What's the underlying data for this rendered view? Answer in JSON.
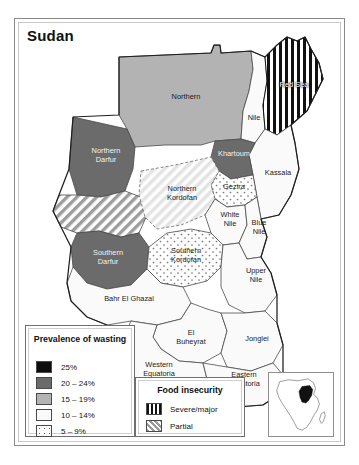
{
  "map": {
    "title": "Sudan",
    "regions": [
      {
        "name": "Northern",
        "label": "Northern",
        "wasting": "15 – 19%",
        "food_insecurity": "none"
      },
      {
        "name": "Nile",
        "label": "Nile",
        "wasting": "10 – 14%",
        "food_insecurity": "none"
      },
      {
        "name": "Red Sea",
        "label": "Red Sea",
        "wasting": "10 – 14%",
        "food_insecurity": "Severe/major"
      },
      {
        "name": "Kassala",
        "label": "Kassala",
        "wasting": "10 – 14%",
        "food_insecurity": "none"
      },
      {
        "name": "Khartoum",
        "label": "Khartoum",
        "wasting": "20 – 24%",
        "food_insecurity": "none"
      },
      {
        "name": "Gezira",
        "label": "Gezira",
        "wasting": "5 – 9%",
        "food_insecurity": "none"
      },
      {
        "name": "Northern Darfur",
        "label": "Northern\nDarfur",
        "wasting": "20 – 24%",
        "food_insecurity": "none"
      },
      {
        "name": "Western Darfur",
        "label": "",
        "wasting": "10 – 14%",
        "food_insecurity": "Partial"
      },
      {
        "name": "Southern Darfur",
        "label": "Southern\nDarfur",
        "wasting": "20 – 24%",
        "food_insecurity": "none"
      },
      {
        "name": "Northern Kordofan",
        "label": "Northern\nKordofan",
        "wasting": "10 – 14%",
        "food_insecurity": "Partial"
      },
      {
        "name": "Southern Kordofan",
        "label": "Southern\nKordofan",
        "wasting": "5 – 9%",
        "food_insecurity": "none"
      },
      {
        "name": "White Nile",
        "label": "White\nNile",
        "wasting": "10 – 14%",
        "food_insecurity": "none"
      },
      {
        "name": "Blue Nile",
        "label": "Blue\nNile",
        "wasting": "10 – 14%",
        "food_insecurity": "none"
      },
      {
        "name": "Upper Nile",
        "label": "Upper\nNile",
        "wasting": "10 – 14%",
        "food_insecurity": "none"
      },
      {
        "name": "Bahr El Ghazal",
        "label": "Bahr El Ghazal",
        "wasting": "10 – 14%",
        "food_insecurity": "none"
      },
      {
        "name": "El Buheyrat",
        "label": "El\nBuheyrat",
        "wasting": "10 – 14%",
        "food_insecurity": "none"
      },
      {
        "name": "Jonglei",
        "label": "Jonglei",
        "wasting": "10 – 14%",
        "food_insecurity": "none"
      },
      {
        "name": "Western Equatoria",
        "label": "Western\nEquatoria",
        "wasting": "10 – 14%",
        "food_insecurity": "none"
      },
      {
        "name": "Eastern Equatoria",
        "label": "Eastern\nEquatoria",
        "wasting": "10 – 14%",
        "food_insecurity": "none"
      }
    ]
  },
  "legend_wasting": {
    "title": "Prevalence of\nwasting",
    "items": [
      {
        "label": "25%",
        "swatch": "fill-25",
        "color": "#0d0d0d"
      },
      {
        "label": "20 – 24%",
        "swatch": "fill-20",
        "color": "#6b6b6b"
      },
      {
        "label": "15 – 19%",
        "swatch": "fill-15",
        "color": "#b3b3b3"
      },
      {
        "label": "10 – 14%",
        "swatch": "fill-10",
        "color": "#fafafa"
      },
      {
        "label": "5 – 9%",
        "swatch": "fill-5",
        "color": "#fbfbfb"
      }
    ]
  },
  "legend_food": {
    "title": "Food insecurity",
    "items": [
      {
        "label": "Severe/major",
        "swatch": "fill-severe"
      },
      {
        "label": "Partial",
        "swatch": "fill-partial"
      }
    ]
  },
  "inset": {
    "name": "africa-locator",
    "highlight_country": "Sudan",
    "highlight_color": "#111111"
  }
}
